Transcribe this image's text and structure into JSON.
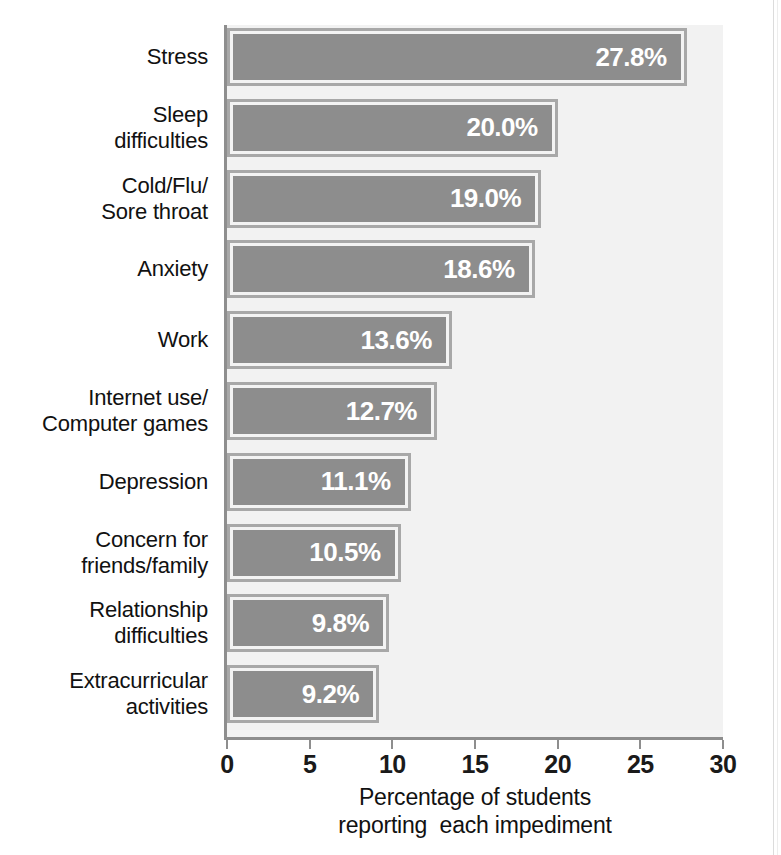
{
  "chart_data": {
    "type": "bar",
    "orientation": "horizontal",
    "title": "",
    "xlabel": "Percentage of students\nreporting  each impediment",
    "ylabel": "",
    "xlim": [
      0,
      30
    ],
    "xticks": [
      0,
      5,
      10,
      15,
      20,
      25,
      30
    ],
    "xtick_labels": [
      "0",
      "5",
      "10",
      "15",
      "20",
      "25",
      "30"
    ],
    "grid": false,
    "legend": false,
    "categories": [
      "Stress",
      "Sleep\ndifficulties",
      "Cold/Flu/\nSore throat",
      "Anxiety",
      "Work",
      "Internet use/\nComputer games",
      "Depression",
      "Concern for\nfriends/family",
      "Relationship\ndifficulties",
      "Extracurricular\nactivities"
    ],
    "values": [
      27.8,
      20.0,
      19.0,
      18.6,
      13.6,
      12.7,
      11.1,
      10.5,
      9.8,
      9.2
    ],
    "value_labels": [
      "27.8%",
      "20.0%",
      "19.0%",
      "18.6%",
      "13.6%",
      "12.7%",
      "11.1%",
      "10.5%",
      "9.8%",
      "9.2%"
    ],
    "colors": {
      "bar_fill": "#8d8d8d",
      "bar_inner_border": "#f3f3f3",
      "bar_outer_border": "#a8a8a8",
      "plot_background": "#f2f2f2",
      "axis_line": "#8e8e8e",
      "value_label_text": "#ffffff",
      "category_label_text": "#111111"
    }
  }
}
